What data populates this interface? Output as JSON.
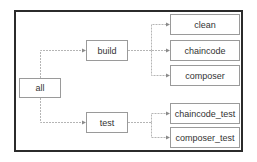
{
  "diagram": {
    "type": "tree",
    "root": "all",
    "nodes": {
      "all": "all",
      "build": "build",
      "test": "test",
      "clean": "clean",
      "chaincode": "chaincode",
      "composer": "composer",
      "chaincode_test": "chaincode_test",
      "composer_test": "composer_test"
    },
    "edges": [
      [
        "all",
        "build"
      ],
      [
        "all",
        "test"
      ],
      [
        "build",
        "clean"
      ],
      [
        "build",
        "chaincode"
      ],
      [
        "build",
        "composer"
      ],
      [
        "test",
        "chaincode_test"
      ],
      [
        "test",
        "composer_test"
      ]
    ],
    "colors": {
      "frame": "#2b2b2b",
      "node_border": "#9a9a9a",
      "edge": "#b5b5b5",
      "text": "#333333"
    }
  }
}
